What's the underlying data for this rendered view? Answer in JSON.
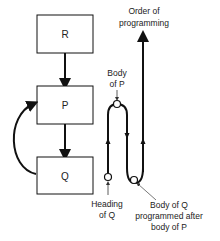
{
  "boxes": {
    "r": {
      "label": "R"
    },
    "p": {
      "label": "P"
    },
    "q": {
      "label": "Q"
    }
  },
  "annotations": {
    "order_line1": "Order of",
    "order_line2": "programming",
    "body_p_line1": "Body",
    "body_p_line2": "of P",
    "heading_q_line1": "Heading",
    "heading_q_line2": "of Q",
    "body_q_line1": "Body of Q",
    "body_q_line2": "programmed after",
    "body_q_line3": "body of P"
  },
  "colors": {
    "stroke": "#111111",
    "text": "#222222",
    "pointer": "#555555"
  }
}
